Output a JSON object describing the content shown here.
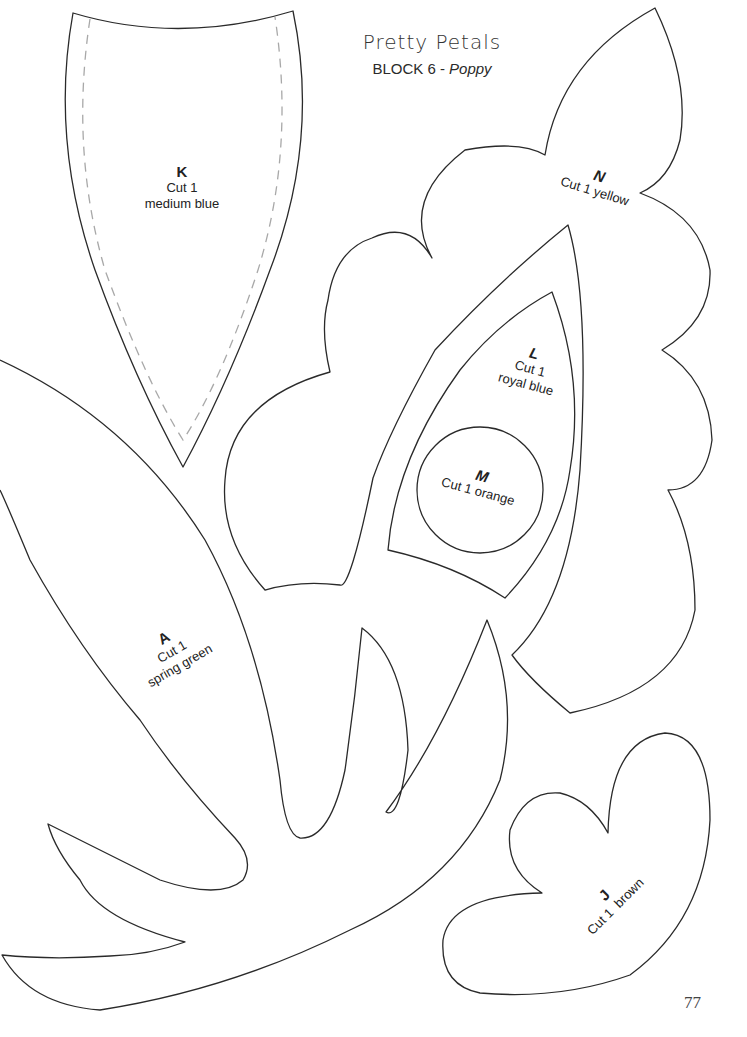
{
  "header": {
    "title": "Pretty Petals",
    "subtitle_block": "BLOCK 6 - ",
    "subtitle_name": "Poppy"
  },
  "pieces": {
    "K": {
      "letter": "K",
      "cut": "Cut 1",
      "color": "medium blue"
    },
    "N": {
      "letter": "N",
      "cut": "Cut 1 yellow"
    },
    "L": {
      "letter": "L",
      "cut": "Cut 1",
      "color": "royal blue"
    },
    "M": {
      "letter": "M",
      "cut": "Cut 1 orange"
    },
    "A": {
      "letter": "A",
      "cut": "Cut 1",
      "color": "spring green"
    },
    "J": {
      "letter": "J",
      "cut": "Cut 1  brown"
    }
  },
  "footer": {
    "page_number": "77"
  }
}
